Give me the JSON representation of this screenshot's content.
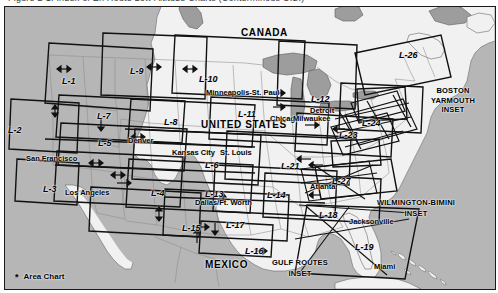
{
  "top_cutoff_text": "Figure 2-1. Index of En Route Low Altitude Charts (Conterminous U.S.)",
  "map": {
    "title": "Index of En Route Low Altitude Charts",
    "colors": {
      "ocean": "#b6b6b6",
      "land": "#f1f1f1",
      "great_lakes": "#9d9d9d",
      "border": "#1a1a1a",
      "chart_outline": "#111111"
    },
    "countries": [
      {
        "name": "CANADA",
        "x": 236,
        "y": 21
      },
      {
        "name": "UNITED STATES",
        "x": 196,
        "y": 113
      },
      {
        "name": "MEXICO",
        "x": 200,
        "y": 253
      }
    ],
    "cities": [
      {
        "name": "Minneapolis-St. Paul",
        "x": 201,
        "y": 82
      },
      {
        "name": "Chicago",
        "x": 265,
        "y": 108
      },
      {
        "name": "Milwaukee",
        "x": 288,
        "y": 108
      },
      {
        "name": "Detroit",
        "x": 305,
        "y": 100
      },
      {
        "name": "Denver",
        "x": 123,
        "y": 130
      },
      {
        "name": "Kansas City",
        "x": 167,
        "y": 142
      },
      {
        "name": "St. Louis",
        "x": 215,
        "y": 142
      },
      {
        "name": "San Francisco",
        "x": 21,
        "y": 148
      },
      {
        "name": "Los Angeles",
        "x": 60,
        "y": 182
      },
      {
        "name": "Dallas/Ft. Worth",
        "x": 190,
        "y": 192
      },
      {
        "name": "Atlanta",
        "x": 305,
        "y": 176
      },
      {
        "name": "Jacksonville",
        "x": 344,
        "y": 211
      },
      {
        "name": "Miami",
        "x": 369,
        "y": 256
      }
    ],
    "chart_labels": [
      {
        "id": "L-1",
        "x": 57,
        "y": 70
      },
      {
        "id": "L-2",
        "x": 3,
        "y": 119
      },
      {
        "id": "L-3",
        "x": 38,
        "y": 178
      },
      {
        "id": "L-4",
        "x": 146,
        "y": 182
      },
      {
        "id": "L-5",
        "x": 93,
        "y": 132
      },
      {
        "id": "L-6",
        "x": 200,
        "y": 154
      },
      {
        "id": "L-7",
        "x": 92,
        "y": 105
      },
      {
        "id": "L-8",
        "x": 159,
        "y": 111
      },
      {
        "id": "L-9",
        "x": 125,
        "y": 60
      },
      {
        "id": "L-10",
        "x": 194,
        "y": 68
      },
      {
        "id": "L-11",
        "x": 233,
        "y": 103
      },
      {
        "id": "L-12",
        "x": 306,
        "y": 88
      },
      {
        "id": "L-13",
        "x": 200,
        "y": 183
      },
      {
        "id": "L-14",
        "x": 262,
        "y": 184
      },
      {
        "id": "L-15",
        "x": 177,
        "y": 217
      },
      {
        "id": "L-16",
        "x": 240,
        "y": 240
      },
      {
        "id": "L-17",
        "x": 221,
        "y": 214
      },
      {
        "id": "L-18",
        "x": 314,
        "y": 204
      },
      {
        "id": "L-19",
        "x": 350,
        "y": 236
      },
      {
        "id": "L-21",
        "x": 276,
        "y": 155
      },
      {
        "id": "L-23",
        "x": 334,
        "y": 124
      },
      {
        "id": "L-24",
        "x": 357,
        "y": 112
      },
      {
        "id": "L-26",
        "x": 394,
        "y": 44
      },
      {
        "id": "L-27",
        "x": 327,
        "y": 170
      }
    ],
    "insets": [
      {
        "lines": [
          "BOSTON",
          "YARMOUTH",
          "INSET"
        ],
        "x": 425,
        "y": 86
      },
      {
        "lines": [
          "WILMINGTON-BIMINI",
          "INSET"
        ],
        "x": 382,
        "y": 198
      },
      {
        "lines": [
          "GULF ROUTES",
          "INSET"
        ],
        "x": 283,
        "y": 258
      }
    ],
    "legend": {
      "marker": "*",
      "label": "Area Chart",
      "x": 17,
      "y": 271
    }
  }
}
